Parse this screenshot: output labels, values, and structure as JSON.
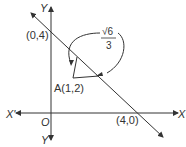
{
  "diagram": {
    "axes": {
      "x_label": "X",
      "x_neg_label": "X'",
      "y_label": "Y",
      "y_neg_label": "Y'",
      "origin_label": "O"
    },
    "points": {
      "y_intercept": "(0,4)",
      "x_intercept": "(4,0)",
      "point_a": "A(1,2)"
    },
    "distance": {
      "numerator": "√6",
      "denominator": "3"
    },
    "colors": {
      "stroke": "#333333",
      "background": "#ffffff"
    }
  }
}
